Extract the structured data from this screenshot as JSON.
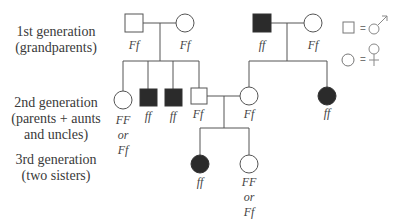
{
  "generation_labels": {
    "gen1": {
      "title": "1st generation",
      "subtitle": "(grandparents)"
    },
    "gen2": {
      "title": "2nd generation",
      "subtitle1": "(parents + aunts",
      "subtitle2": "and uncles)"
    },
    "gen3": {
      "title": "3rd generation",
      "subtitle": "(two sisters)"
    }
  },
  "individuals": {
    "gen1_left_male": {
      "sex": "male",
      "affected": false,
      "genotype": "Ff"
    },
    "gen1_left_female": {
      "sex": "female",
      "affected": false,
      "genotype": "Ff"
    },
    "gen1_right_male": {
      "sex": "male",
      "affected": true,
      "genotype": "ff"
    },
    "gen1_right_female": {
      "sex": "female",
      "affected": false,
      "genotype": "Ff"
    },
    "gen2_female_1": {
      "sex": "female",
      "affected": false,
      "genotype_line1": "FF",
      "genotype_line2": "or",
      "genotype_line3": "Ff"
    },
    "gen2_male_2": {
      "sex": "male",
      "affected": true,
      "genotype": "ff"
    },
    "gen2_male_3": {
      "sex": "male",
      "affected": true,
      "genotype": "ff"
    },
    "gen2_male_4": {
      "sex": "male",
      "affected": false,
      "genotype": "Ff"
    },
    "gen2_female_5": {
      "sex": "female",
      "affected": false,
      "genotype": "Ff"
    },
    "gen2_female_6": {
      "sex": "female",
      "affected": true,
      "genotype": "ff"
    },
    "gen3_female_1": {
      "sex": "female",
      "affected": true,
      "genotype": "ff"
    },
    "gen3_female_2": {
      "sex": "female",
      "affected": false,
      "genotype_line1": "FF",
      "genotype_line2": "or",
      "genotype_line3": "Ff"
    }
  },
  "legend": {
    "male": {
      "symbol": "square",
      "equals": "=",
      "meaning": "male (♂)"
    },
    "female": {
      "symbol": "circle",
      "equals": "=",
      "meaning": "female (♀)"
    }
  },
  "colors": {
    "line": "#555555",
    "affected_fill": "#2b2b2b",
    "unaffected_fill": "#ffffff"
  }
}
